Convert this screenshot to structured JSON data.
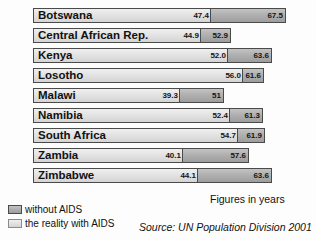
{
  "chart_data": {
    "type": "bar",
    "title": "",
    "xlabel": "",
    "ylabel": "",
    "units_note": "Figures in years",
    "source": "Source: UN Population Division 2001",
    "xlim": [
      0,
      72
    ],
    "grid": false,
    "legend_position": "bottom-left",
    "orientation": "horizontal",
    "categories": [
      "Botswana",
      "Central African Rep.",
      "Kenya",
      "Losotho",
      "Malawi",
      "Namibia",
      "South Africa",
      "Zambia",
      "Zimbabwe"
    ],
    "series": [
      {
        "name": "without AIDS",
        "color": "#b0b0b0",
        "values": [
          67.5,
          52.9,
          63.6,
          61.6,
          51,
          61.3,
          61.9,
          57.6,
          63.6
        ],
        "labels": [
          "67.5",
          "52.9",
          "63.6",
          "61.6",
          "51",
          "61.3",
          "61.9",
          "57.6",
          "63.6"
        ]
      },
      {
        "name": "the reality with AIDS",
        "color": "#e2e2e2",
        "values": [
          47.4,
          44.9,
          52.0,
          56.0,
          39.3,
          52.4,
          54.7,
          40.1,
          44.1
        ],
        "labels": [
          "47.4",
          "44.9",
          "52.0",
          "56.0",
          "39.3",
          "52.4",
          "54.7",
          "40.1",
          "44.1"
        ]
      }
    ]
  },
  "legend": {
    "items": [
      {
        "label": "without AIDS"
      },
      {
        "label": "the reality with AIDS"
      }
    ]
  }
}
